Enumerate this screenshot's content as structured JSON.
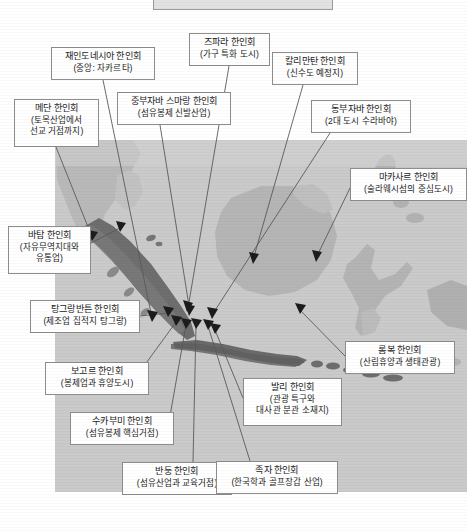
{
  "figure": {
    "type": "annotated-map",
    "region": "Indonesia",
    "top_fragment_label": ""
  },
  "labels": [
    {
      "id": "medan",
      "title": "메단 한인회",
      "sub": "(토목산업에서",
      "sub2": "선교 거점까지)",
      "x": 14,
      "y": 99,
      "w": 85,
      "h": 48
    },
    {
      "id": "indonesia-central",
      "title": "재인도네시아 한인회",
      "sub": "(중앙: 자카르타)",
      "sub2": "",
      "x": 51,
      "y": 47,
      "w": 104,
      "h": 33
    },
    {
      "id": "semarang",
      "title": "중부자바 스마랑 한인회",
      "sub": "(섬유봉제 신발산업)",
      "sub2": "",
      "x": 117,
      "y": 92,
      "w": 114,
      "h": 33
    },
    {
      "id": "jepara",
      "title": "즈파라 한인회",
      "sub": "(가구 특화 도시)",
      "sub2": "",
      "x": 189,
      "y": 33,
      "w": 81,
      "h": 33
    },
    {
      "id": "kalimantan",
      "title": "칼리만탄 한인회",
      "sub": "(신수도 예정지)",
      "sub2": "",
      "x": 272,
      "y": 52,
      "w": 86,
      "h": 33
    },
    {
      "id": "east-java",
      "title": "동부자바 한인회",
      "sub": "(2대 도시 수라바야)",
      "sub2": "",
      "x": 311,
      "y": 100,
      "w": 100,
      "h": 33
    },
    {
      "id": "makassar",
      "title": "마카사르 한인회",
      "sub": "(술라웨시섬의 중심도시)",
      "sub2": "",
      "x": 350,
      "y": 168,
      "w": 117,
      "h": 33
    },
    {
      "id": "batam",
      "title": "바탐 한인회",
      "sub": "(자유무역지대와",
      "sub2": "유통업)",
      "x": 8,
      "y": 226,
      "w": 83,
      "h": 48
    },
    {
      "id": "tangerang-banten",
      "title": "탕그랑반튼 한인회",
      "sub": "(제조업 집적지 탕그랑)",
      "sub2": "",
      "x": 30,
      "y": 300,
      "w": 110,
      "h": 33
    },
    {
      "id": "bogor",
      "title": "보고르 한인회",
      "sub": "(봉제업과 휴양도시)",
      "sub2": "",
      "x": 45,
      "y": 362,
      "w": 104,
      "h": 33
    },
    {
      "id": "sukabumi",
      "title": "수카부미 한인회",
      "sub": "(섬유봉제 핵심거점)",
      "sub2": "",
      "x": 70,
      "y": 412,
      "w": 104,
      "h": 33
    },
    {
      "id": "bandung",
      "title": "반둥 한인회",
      "sub": "(섬유산업과 교육거점)",
      "sub2": "",
      "x": 122,
      "y": 462,
      "w": 110,
      "h": 33
    },
    {
      "id": "bali",
      "title": "발리 한인회",
      "sub": "(관광 특구와",
      "sub2": "대사관 분관 소재지)",
      "x": 243,
      "y": 378,
      "w": 99,
      "h": 48
    },
    {
      "id": "jogja",
      "title": "족자 한인회",
      "sub": "(한국학과 골프장갑 산업)",
      "sub2": "",
      "x": 216,
      "y": 461,
      "w": 122,
      "h": 33
    },
    {
      "id": "lombok",
      "title": "롬복 한인회",
      "sub": "(산림휴양과 생태관광)",
      "sub2": "",
      "x": 345,
      "y": 341,
      "w": 110,
      "h": 33
    }
  ],
  "colors": {
    "map_sea": "#c9c9c9",
    "map_land_light": "#bdbdbd",
    "map_land_dark": "#6f6f6f",
    "box_border": "#8d8d8d",
    "text": "#1b1b1b",
    "leader_line": "#555555"
  }
}
